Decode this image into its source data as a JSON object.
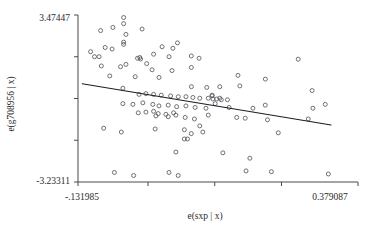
{
  "chart_data": {
    "type": "scatter",
    "title": "",
    "xlabel": "e(sxp | x)",
    "ylabel": "e(g708956 | x)",
    "xlim": [
      -0.131985,
      0.379087
    ],
    "ylim": [
      -3.23311,
      3.47447
    ],
    "xtick_labels": [
      "-.131985",
      "0.379087"
    ],
    "ytick_labels": [
      "3.47447",
      "-3.23311"
    ],
    "xticks": [
      -0.131985,
      -0.0042,
      0.1176,
      0.2394,
      0.379087
    ],
    "yticks": [
      3.47447,
      1.7975,
      0.1206,
      -1.5562,
      -3.23311
    ],
    "grid": false,
    "legend": null,
    "fit_line": {
      "x_start": -0.1244,
      "y_start": 0.7166,
      "x_end": 0.3299,
      "y_end": -0.94
    },
    "points": [
      {
        "x": -0.0907,
        "y": 2.849
      },
      {
        "x": -0.0487,
        "y": 3.3735
      },
      {
        "x": -0.0487,
        "y": 3.1266
      },
      {
        "x": -0.0683,
        "y": 2.9723
      },
      {
        "x": -0.015,
        "y": 2.9105
      },
      {
        "x": -0.0445,
        "y": 2.6944
      },
      {
        "x": -0.0487,
        "y": 2.3855
      },
      {
        "x": -0.0824,
        "y": 2.1695
      },
      {
        "x": -0.0698,
        "y": 2.1078
      },
      {
        "x": -0.0487,
        "y": 2.2929
      },
      {
        "x": 0.0215,
        "y": 2.2003
      },
      {
        "x": 0.0412,
        "y": 2.1386
      },
      {
        "x": 0.0496,
        "y": 2.3546
      },
      {
        "x": -0.1019,
        "y": 1.7993
      },
      {
        "x": -0.0936,
        "y": 1.7993
      },
      {
        "x": -0.0234,
        "y": 1.7375
      },
      {
        "x": -0.0192,
        "y": 1.7684
      },
      {
        "x": -0.0178,
        "y": 1.7066
      },
      {
        "x": 0.0342,
        "y": 1.7993
      },
      {
        "x": 0.0749,
        "y": 1.8302
      },
      {
        "x": 0.089,
        "y": 1.7375
      },
      {
        "x": -0.0894,
        "y": 1.4286
      },
      {
        "x": -0.0543,
        "y": 1.3977
      },
      {
        "x": -0.0445,
        "y": 1.4903
      },
      {
        "x": -0.0066,
        "y": 1.5212
      },
      {
        "x": 0.0032,
        "y": 1.2743
      },
      {
        "x": 0.0397,
        "y": 1.2434
      },
      {
        "x": 0.0749,
        "y": 1.3669
      },
      {
        "x": -0.074,
        "y": 1.0273
      },
      {
        "x": -0.0276,
        "y": 0.9964
      },
      {
        "x": 0.0159,
        "y": 0.9656
      },
      {
        "x": 0.075,
        "y": 0.595
      },
      {
        "x": 0.103,
        "y": 0.5641
      },
      {
        "x": 0.1268,
        "y": 0.595
      },
      {
        "x": 0.1634,
        "y": 0.6259
      },
      {
        "x": 0.2953,
        "y": 0.4405
      },
      {
        "x": -0.0501,
        "y": 0.5333
      },
      {
        "x": -0.0206,
        "y": 0.2862
      },
      {
        "x": -0.008,
        "y": 0.3171
      },
      {
        "x": 0.006,
        "y": 0.2862
      },
      {
        "x": 0.02,
        "y": 0.2553
      },
      {
        "x": 0.037,
        "y": 0.2244
      },
      {
        "x": 0.051,
        "y": 0.1935
      },
      {
        "x": 0.0651,
        "y": 0.1935
      },
      {
        "x": 0.0777,
        "y": 0.1626
      },
      {
        "x": 0.0903,
        "y": 0.1317
      },
      {
        "x": 0.1058,
        "y": 0.1317
      },
      {
        "x": 0.1128,
        "y": 0.2553
      },
      {
        "x": 0.1128,
        "y": 0.2244
      },
      {
        "x": 0.1142,
        "y": 0.1008
      },
      {
        "x": 0.1212,
        "y": 0.1008
      },
      {
        "x": 0.1268,
        "y": 0.1317
      },
      {
        "x": 0.1296,
        "y": 0.07
      },
      {
        "x": 0.1408,
        "y": 0.07
      },
      {
        "x": -0.0501,
        "y": -0.0845
      },
      {
        "x": -0.0318,
        "y": -0.1154
      },
      {
        "x": -0.0136,
        "y": -0.0536
      },
      {
        "x": 0.0046,
        "y": -0.1154
      },
      {
        "x": 0.0158,
        "y": -0.1771
      },
      {
        "x": 0.0327,
        "y": -0.1463
      },
      {
        "x": 0.0481,
        "y": -0.208
      },
      {
        "x": 0.065,
        "y": -0.1771
      },
      {
        "x": 0.0818,
        "y": -0.2389
      },
      {
        "x": 0.1016,
        "y": -0.2698
      },
      {
        "x": 0.1184,
        "y": -0.0845
      },
      {
        "x": 0.1437,
        "y": -0.2389
      },
      {
        "x": 0.1873,
        "y": -0.2698
      },
      {
        "x": 0.2098,
        "y": -0.1463
      },
      {
        "x": 0.2968,
        "y": -0.2698
      },
      {
        "x": 0.3193,
        "y": -0.1154
      },
      {
        "x": -0.022,
        "y": -0.455
      },
      {
        "x": -0.008,
        "y": -0.4241
      },
      {
        "x": 0.006,
        "y": -0.3932
      },
      {
        "x": 0.0144,
        "y": -0.4859
      },
      {
        "x": 0.0285,
        "y": -0.5168
      },
      {
        "x": 0.0425,
        "y": -0.455
      },
      {
        "x": 0.0102,
        "y": -0.5786
      },
      {
        "x": 0.0327,
        "y": -0.6095
      },
      {
        "x": 0.0467,
        "y": -0.5477
      },
      {
        "x": 0.0636,
        "y": -0.6404
      },
      {
        "x": 0.0805,
        "y": -0.7021
      },
      {
        "x": 0.1058,
        "y": -0.5477
      },
      {
        "x": 0.1577,
        "y": -0.6404
      },
      {
        "x": 0.1732,
        "y": -0.6713
      },
      {
        "x": 0.2139,
        "y": -0.733
      },
      {
        "x": 0.2883,
        "y": -0.7021
      },
      {
        "x": -0.0852,
        "y": -1.0727
      },
      {
        "x": -0.0529,
        "y": -1.2272
      },
      {
        "x": 0.0088,
        "y": -1.1036
      },
      {
        "x": 0.0622,
        "y": -1.1345
      },
      {
        "x": 0.0748,
        "y": -1.289
      },
      {
        "x": 0.0903,
        "y": -0.98
      },
      {
        "x": 0.0959,
        "y": -1.2272
      },
      {
        "x": 0.0621,
        "y": -1.5053
      },
      {
        "x": 0.0678,
        "y": -1.5053
      },
      {
        "x": 0.2336,
        "y": -1.2581
      },
      {
        "x": 0.0467,
        "y": -2.0305
      },
      {
        "x": 0.1324,
        "y": -2.0614
      },
      {
        "x": 0.1817,
        "y": -2.2776
      },
      {
        "x": -0.0656,
        "y": -2.849
      },
      {
        "x": -0.0304,
        "y": -2.9725
      },
      {
        "x": 0.0341,
        "y": -2.849
      },
      {
        "x": 0.0509,
        "y": -2.9725
      },
      {
        "x": 0.1747,
        "y": -2.7872
      },
      {
        "x": 0.221,
        "y": -2.8181
      },
      {
        "x": 0.325,
        "y": -2.9107
      },
      {
        "x": -0.109,
        "y": 2.0
      },
      {
        "x": 0.006,
        "y": 1.9
      },
      {
        "x": 0.27,
        "y": 1.7
      },
      {
        "x": 0.21,
        "y": 0.9
      },
      {
        "x": 0.16,
        "y": 1.05
      }
    ]
  }
}
